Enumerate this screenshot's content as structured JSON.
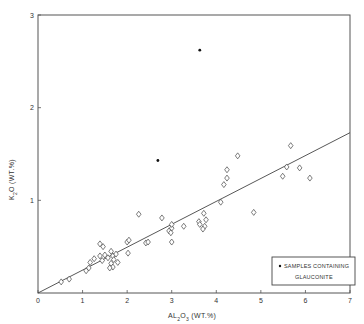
{
  "chart_data": {
    "type": "scatter",
    "title": "",
    "xlabel": "AL2O3 (WT.%)",
    "ylabel": "K2O (WT.%)",
    "xlim": [
      0,
      7
    ],
    "ylim": [
      0,
      3
    ],
    "x_ticks": [
      "0",
      "1",
      "2",
      "3",
      "4",
      "5",
      "6",
      "7"
    ],
    "y_ticks": [
      "1",
      "2",
      "3"
    ],
    "grid": false,
    "legend_position": "lower right (inside)",
    "legend": {
      "marker": "filled dot",
      "line1": "SAMPLES CONTAINING",
      "line2": "GLAUCONITE"
    },
    "series": [
      {
        "name": "Samples",
        "marker": "open diamond",
        "points": [
          [
            0.52,
            0.12
          ],
          [
            0.7,
            0.15
          ],
          [
            1.08,
            0.24
          ],
          [
            1.14,
            0.27
          ],
          [
            1.17,
            0.33
          ],
          [
            1.26,
            0.37
          ],
          [
            1.39,
            0.53
          ],
          [
            1.46,
            0.5
          ],
          [
            1.39,
            0.4
          ],
          [
            1.44,
            0.35
          ],
          [
            1.5,
            0.41
          ],
          [
            1.57,
            0.38
          ],
          [
            1.64,
            0.45
          ],
          [
            1.68,
            0.4
          ],
          [
            1.64,
            0.32
          ],
          [
            1.68,
            0.28
          ],
          [
            1.7,
            0.36
          ],
          [
            1.75,
            0.42
          ],
          [
            1.79,
            0.33
          ],
          [
            1.61,
            0.27
          ],
          [
            2.0,
            0.55
          ],
          [
            2.04,
            0.57
          ],
          [
            2.02,
            0.43
          ],
          [
            2.26,
            0.85
          ],
          [
            2.42,
            0.54
          ],
          [
            2.47,
            0.55
          ],
          [
            2.78,
            0.81
          ],
          [
            2.94,
            0.67
          ],
          [
            3.0,
            0.7
          ],
          [
            2.98,
            0.65
          ],
          [
            3.0,
            0.55
          ],
          [
            3.0,
            0.74
          ],
          [
            3.27,
            0.72
          ],
          [
            3.61,
            0.77
          ],
          [
            3.72,
            0.86
          ],
          [
            3.77,
            0.79
          ],
          [
            3.74,
            0.72
          ],
          [
            3.7,
            0.69
          ],
          [
            3.63,
            0.74
          ],
          [
            4.1,
            0.98
          ],
          [
            4.17,
            1.17
          ],
          [
            4.24,
            1.24
          ],
          [
            4.24,
            1.33
          ],
          [
            4.48,
            1.48
          ],
          [
            4.84,
            0.87
          ],
          [
            5.49,
            1.26
          ],
          [
            5.58,
            1.36
          ],
          [
            5.67,
            1.59
          ],
          [
            5.87,
            1.35
          ],
          [
            6.1,
            1.24
          ]
        ]
      },
      {
        "name": "Samples containing glauconite",
        "marker": "filled dot",
        "points": [
          [
            3.63,
            2.62
          ],
          [
            2.69,
            1.43
          ]
        ]
      }
    ],
    "trend_line": {
      "from": [
        0,
        0
      ],
      "to": [
        7,
        1.73
      ]
    }
  }
}
